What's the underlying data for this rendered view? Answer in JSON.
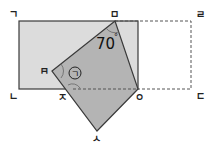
{
  "diagram": {
    "vertex_labels": {
      "top_left": "ㄱ",
      "bottom_left": "ㄴ",
      "bottom_right": "ㄷ",
      "top_right": "ㄹ",
      "fold_top": "ㅁ",
      "fold_left": "ㅂ",
      "fold_bottom": "ㅅ",
      "fold_right": "ㅇ",
      "cross_point": "ㅈ"
    },
    "angle_label": "70",
    "angle_unit": "°",
    "unknown_angle_label": "㉠",
    "colors": {
      "rectangle_fill": "#dcdcdc",
      "folded_fill": "#b4b4b4",
      "stroke": "#3a3a3a",
      "dashed": "#555555"
    }
  }
}
